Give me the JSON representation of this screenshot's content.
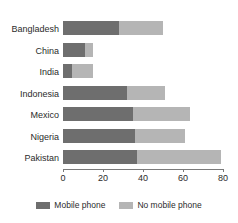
{
  "chart_data": {
    "type": "bar",
    "orientation": "horizontal",
    "stacked": true,
    "title": "",
    "xlabel": "",
    "ylabel": "",
    "xlim": [
      0,
      80
    ],
    "xticks": [
      0,
      20,
      40,
      60,
      80
    ],
    "xtick_labels": [
      "0",
      "20",
      "40",
      "60",
      "80"
    ],
    "grid": false,
    "legend_position": "bottom",
    "categories": [
      "Bangladesh",
      "China",
      "India",
      "Indonesia",
      "Mexico",
      "Nigeria",
      "Pakistan"
    ],
    "series": [
      {
        "name": "Mobile phone",
        "color": "#6e6e6e",
        "values": [
          28,
          11,
          4.5,
          32,
          35,
          36,
          37
        ]
      },
      {
        "name": "No mobile phone",
        "color": "#b5b5b5",
        "values": [
          22,
          4,
          10.5,
          19,
          28.5,
          25,
          42
        ]
      }
    ],
    "totals": [
      50,
      15,
      15,
      51,
      63.5,
      61,
      79
    ]
  },
  "legend": {
    "items": [
      {
        "label": "Mobile phone",
        "swatch": "mobile"
      },
      {
        "label": "No mobile phone",
        "swatch": "nomobile"
      }
    ]
  }
}
